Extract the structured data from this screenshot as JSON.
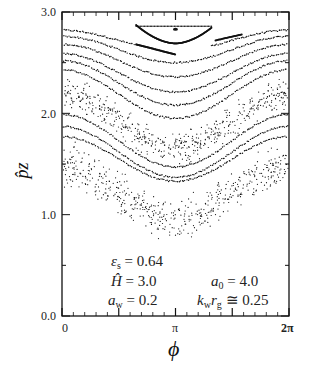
{
  "chart_data": {
    "type": "scatter",
    "subtype": "poincare-surface-of-section",
    "title": "",
    "xlabel": "ϕ",
    "ylabel": "p̂z",
    "xlim": [
      0,
      6.2832
    ],
    "ylim": [
      0.0,
      3.0
    ],
    "x_ticks": [
      {
        "value": 0,
        "label": "0"
      },
      {
        "value": 3.1416,
        "label": "π"
      },
      {
        "value": 6.2832,
        "label": "2π"
      }
    ],
    "y_ticks": [
      {
        "value": 0.0,
        "label": "0.0"
      },
      {
        "value": 1.0,
        "label": "1.0"
      },
      {
        "value": 2.0,
        "label": "2.0"
      },
      {
        "value": 3.0,
        "label": "3.0"
      }
    ],
    "grid": false,
    "legend": null,
    "annotations": [
      {
        "text": "εs = 0.64",
        "symbol": "ε",
        "sub": "s",
        "value": "0.64"
      },
      {
        "text": "Ĥ = 3.0",
        "symbol": "Ĥ",
        "sub": "",
        "value": "3.0"
      },
      {
        "text": "aw = 0.2",
        "symbol": "a",
        "sub": "w",
        "value": "0.2"
      },
      {
        "text": "a0 = 4.0",
        "symbol": "a",
        "sub": "0",
        "value": "4.0"
      },
      {
        "text": "kw rg ≅ 0.25",
        "symbol": "k",
        "sub": "w",
        "symbol2": "r",
        "sub2": "g",
        "relation": "≅",
        "value": "0.25"
      }
    ],
    "series": [
      {
        "name": "island-separatrix",
        "kind": "closed-orbit",
        "center_x": 3.14,
        "center_y": 2.82,
        "y_top": 2.86,
        "y_bottom": 2.69,
        "x_left": 2.05,
        "x_right": 4.15
      },
      {
        "name": "island-center",
        "kind": "fixed-point",
        "x": 3.14,
        "y": 2.83
      },
      {
        "name": "kam-1",
        "kind": "curve",
        "mean": 2.72,
        "amp": 0.1,
        "note": "broken near π, plotted on both sides"
      },
      {
        "name": "kam-2",
        "kind": "curve",
        "mean": 2.63,
        "amp": 0.13
      },
      {
        "name": "kam-3",
        "kind": "curve",
        "mean": 2.52,
        "amp": 0.16
      },
      {
        "name": "kam-4",
        "kind": "curve",
        "mean": 2.4,
        "amp": 0.19
      },
      {
        "name": "kam-5",
        "kind": "curve",
        "mean": 2.3,
        "amp": 0.22
      },
      {
        "name": "kam-6",
        "kind": "curve",
        "mean": 2.19,
        "amp": 0.24
      },
      {
        "name": "chaotic-band-upper",
        "kind": "scatter-band",
        "mean": 1.92,
        "amp": 0.26,
        "width": 0.22
      },
      {
        "name": "kam-7",
        "kind": "curve",
        "mean": 1.73,
        "amp": 0.26
      },
      {
        "name": "kam-8",
        "kind": "curve",
        "mean": 1.62,
        "amp": 0.25
      },
      {
        "name": "kam-9",
        "kind": "curve",
        "mean": 1.55,
        "amp": 0.22
      },
      {
        "name": "chaotic-band-lower",
        "kind": "scatter-band",
        "mean": 1.22,
        "amp": 0.26,
        "width": 0.28
      }
    ],
    "curve_shape": "p = mean + amp * cos(phi)  (minimum at phi = π)"
  }
}
